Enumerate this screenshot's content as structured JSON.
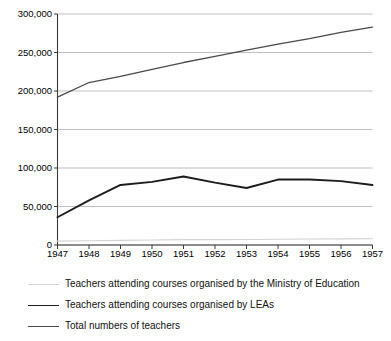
{
  "chart_data": {
    "type": "line",
    "title": "",
    "subtitle": "",
    "xlabel": "",
    "ylabel": "",
    "grid": true,
    "legend_position": "bottom-left",
    "x": [
      1947,
      1948,
      1949,
      1950,
      1951,
      1952,
      1953,
      1954,
      1955,
      1956,
      1957
    ],
    "categories": [
      "1947",
      "1948",
      "1949",
      "1950",
      "1951",
      "1952",
      "1953",
      "1954",
      "1955",
      "1956",
      "1957"
    ],
    "xlim": [
      1947,
      1957
    ],
    "ylim": [
      0,
      300000
    ],
    "ytick_values": [
      0,
      50000,
      100000,
      150000,
      200000,
      250000,
      300000
    ],
    "ytick_labels": [
      "0",
      "50,000",
      "100,000",
      "150,000",
      "200,000",
      "250,000",
      "300,000"
    ],
    "series": [
      {
        "name": "Teachers attending courses organised by the Ministry of Education",
        "color": "#d2d2d2",
        "width": 1.1,
        "values": [
          5000,
          5500,
          6000,
          6500,
          7000,
          7000,
          7200,
          7500,
          7800,
          8000,
          8200
        ]
      },
      {
        "name": "Teachers attending courses organised by LEAs",
        "color": "#1c1c1c",
        "width": 1.9,
        "values": [
          36000,
          58000,
          78000,
          82000,
          89000,
          81000,
          74000,
          85000,
          85000,
          83000,
          78000
        ]
      },
      {
        "name": "Total numbers of teachers",
        "color": "#4a4a4a",
        "width": 1.3,
        "values": [
          192000,
          211000,
          219000,
          228000,
          237000,
          245000,
          253000,
          261000,
          268000,
          276000,
          283000
        ]
      }
    ]
  },
  "legend": {
    "entries": [
      {
        "label": "Teachers attending courses organised by the Ministry of Education"
      },
      {
        "label": "Teachers attending courses organised by LEAs"
      },
      {
        "label": "Total numbers of teachers"
      }
    ]
  },
  "axes": {
    "axis_color": "#3a3a3a",
    "grid_color": "#b8b8b8"
  }
}
